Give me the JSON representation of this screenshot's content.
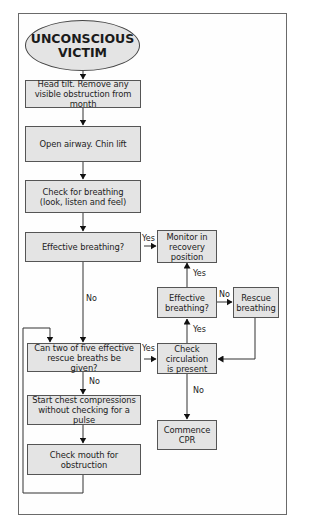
{
  "flowchart": {
    "start": {
      "line1": "UNCONSCIOUS",
      "line2": "VICTIM"
    },
    "steps": {
      "head_tilt": "Head tilt. Remove any visible obstruction from month",
      "open_airway": "Open airway. Chin lift",
      "check_breathing": "Check for breathing (look, listen and feel)",
      "effective_breathing_1": "Effective breathing?",
      "monitor": "Monitor in recovery position",
      "effective_breathing_2": "Effective breathing?",
      "rescue_breathing": "Rescue breathing",
      "can_two_of_five": "Can two of five effective rescue breaths be given?",
      "check_circulation": "Check circulation is present",
      "start_chest": "Start chest compressions without checking for a pulse",
      "commence_cpr": "Commence CPR",
      "check_mouth": "Check mouth for obstruction"
    },
    "labels": {
      "yes_eb1_monitor": "Yes",
      "no_eb1_down": "No",
      "yes_eb2_monitor": "Yes",
      "no_eb2_rescue": "No",
      "yes_circ_eb2": "Yes",
      "yes_two_circ": "Yes",
      "no_two_chest": "No",
      "no_circ_cpr": "No"
    }
  }
}
